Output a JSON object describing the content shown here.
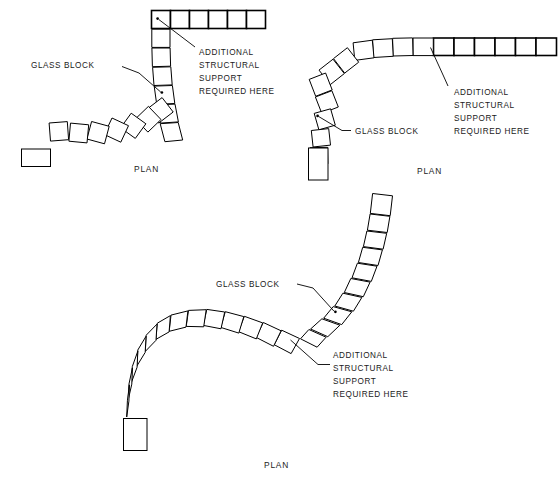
{
  "drawing": {
    "title": "Glass Block Wall Curve Plan Details",
    "background_color": "#ffffff",
    "line_color": "#000000",
    "text_color": "#1a1a1a"
  },
  "labels": {
    "glass_block": "GLASS BLOCK",
    "plan": "PLAN",
    "note_line_1": "ADDITIONAL",
    "note_line_2": "STRUCTURAL",
    "note_line_3": "SUPPORT",
    "note_line_4": "REQUIRED HERE"
  },
  "details": [
    {
      "id": "detail-1",
      "name": "ninety-degree-curve-left",
      "caption": "PLAN",
      "glass_block_label": "GLASS BLOCK",
      "note": [
        "ADDITIONAL",
        "STRUCTURAL",
        "SUPPORT",
        "REQUIRED HERE"
      ],
      "curved_block_count": 13,
      "straight_block_count": 6,
      "straight_run_orientation": "horizontal-top-right",
      "tail_run_orientation": "horizontal-bottom-left"
    },
    {
      "id": "detail-2",
      "name": "quarter-curve-right",
      "caption": "PLAN",
      "glass_block_label": "GLASS BLOCK",
      "note": [
        "ADDITIONAL",
        "STRUCTURAL",
        "SUPPORT",
        "REQUIRED HERE"
      ],
      "curved_block_count": 12,
      "straight_block_count": 6,
      "straight_run_orientation": "horizontal-right",
      "tail_run_orientation": "vertical-bottom-left"
    },
    {
      "id": "detail-3",
      "name": "s-curve-serpentine",
      "caption": "PLAN",
      "glass_block_label": "GLASS BLOCK",
      "note": [
        "ADDITIONAL",
        "STRUCTURAL",
        "SUPPORT",
        "REQUIRED HERE"
      ],
      "curved_block_count": 22,
      "straight_block_count": 0,
      "shape": "reverse-curve"
    }
  ]
}
